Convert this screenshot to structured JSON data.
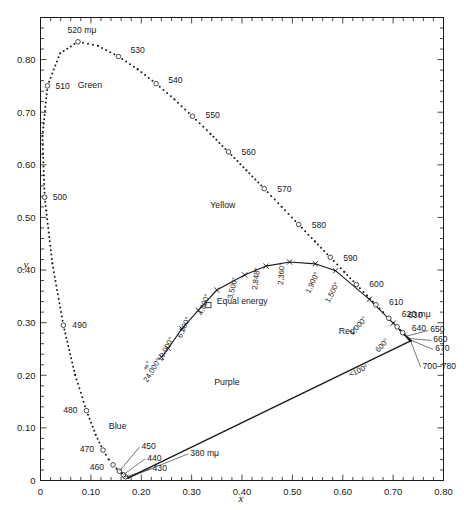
{
  "chart_data": {
    "type": "scatter",
    "title": "",
    "xlabel": "x",
    "ylabel": "y",
    "xlim": [
      0,
      0.8
    ],
    "ylim": [
      0,
      0.88
    ],
    "grid": false,
    "legend": "none",
    "x_ticks": [
      "0",
      "0.10",
      "0.20",
      "0.30",
      "0.40",
      "0.50",
      "0.60",
      "0.70",
      "0.80"
    ],
    "x_tick_values": [
      0,
      0.1,
      0.2,
      0.3,
      0.4,
      0.5,
      0.6,
      0.7,
      0.8
    ],
    "y_ticks": [
      "0",
      "0.10",
      "0.20",
      "0.30",
      "0.40",
      "0.50",
      "0.60",
      "0.70",
      "0.80"
    ],
    "y_tick_values": [
      0,
      0.1,
      0.2,
      0.3,
      0.4,
      0.5,
      0.6,
      0.7,
      0.8
    ],
    "minor_tick_step": 0.02,
    "series": [
      {
        "name": "spectral-locus",
        "style": "dotted-points",
        "points": [
          {
            "wl": 380,
            "x": 0.1741,
            "y": 0.005
          },
          {
            "wl": 385,
            "x": 0.174,
            "y": 0.005
          },
          {
            "wl": 390,
            "x": 0.1738,
            "y": 0.0049
          },
          {
            "wl": 395,
            "x": 0.1736,
            "y": 0.0049
          },
          {
            "wl": 400,
            "x": 0.1733,
            "y": 0.0048
          },
          {
            "wl": 405,
            "x": 0.173,
            "y": 0.0048
          },
          {
            "wl": 410,
            "x": 0.1726,
            "y": 0.0048
          },
          {
            "wl": 415,
            "x": 0.1721,
            "y": 0.0048
          },
          {
            "wl": 420,
            "x": 0.1714,
            "y": 0.0051
          },
          {
            "wl": 425,
            "x": 0.1703,
            "y": 0.0058
          },
          {
            "wl": 430,
            "x": 0.1689,
            "y": 0.0069
          },
          {
            "wl": 435,
            "x": 0.1669,
            "y": 0.0086
          },
          {
            "wl": 440,
            "x": 0.1644,
            "y": 0.0109
          },
          {
            "wl": 445,
            "x": 0.1611,
            "y": 0.0138
          },
          {
            "wl": 450,
            "x": 0.1566,
            "y": 0.0177
          },
          {
            "wl": 455,
            "x": 0.151,
            "y": 0.0227
          },
          {
            "wl": 460,
            "x": 0.144,
            "y": 0.0297
          },
          {
            "wl": 465,
            "x": 0.1355,
            "y": 0.0399
          },
          {
            "wl": 470,
            "x": 0.1241,
            "y": 0.0578
          },
          {
            "wl": 475,
            "x": 0.1096,
            "y": 0.0868
          },
          {
            "wl": 480,
            "x": 0.0913,
            "y": 0.1327
          },
          {
            "wl": 485,
            "x": 0.0687,
            "y": 0.2007
          },
          {
            "wl": 490,
            "x": 0.0454,
            "y": 0.295
          },
          {
            "wl": 495,
            "x": 0.0235,
            "y": 0.4127
          },
          {
            "wl": 500,
            "x": 0.0082,
            "y": 0.5384
          },
          {
            "wl": 505,
            "x": 0.0039,
            "y": 0.6548
          },
          {
            "wl": 510,
            "x": 0.0139,
            "y": 0.7502
          },
          {
            "wl": 515,
            "x": 0.0389,
            "y": 0.812
          },
          {
            "wl": 520,
            "x": 0.0743,
            "y": 0.8338
          },
          {
            "wl": 525,
            "x": 0.1142,
            "y": 0.8262
          },
          {
            "wl": 530,
            "x": 0.1547,
            "y": 0.8059
          },
          {
            "wl": 535,
            "x": 0.1929,
            "y": 0.7816
          },
          {
            "wl": 540,
            "x": 0.2296,
            "y": 0.7543
          },
          {
            "wl": 545,
            "x": 0.2658,
            "y": 0.7243
          },
          {
            "wl": 550,
            "x": 0.3016,
            "y": 0.6923
          },
          {
            "wl": 555,
            "x": 0.3373,
            "y": 0.6589
          },
          {
            "wl": 560,
            "x": 0.3731,
            "y": 0.6245
          },
          {
            "wl": 565,
            "x": 0.4087,
            "y": 0.5896
          },
          {
            "wl": 570,
            "x": 0.4441,
            "y": 0.5547
          },
          {
            "wl": 575,
            "x": 0.4788,
            "y": 0.5202
          },
          {
            "wl": 580,
            "x": 0.5125,
            "y": 0.4866
          },
          {
            "wl": 585,
            "x": 0.5448,
            "y": 0.4544
          },
          {
            "wl": 590,
            "x": 0.5752,
            "y": 0.4242
          },
          {
            "wl": 595,
            "x": 0.6029,
            "y": 0.3965
          },
          {
            "wl": 600,
            "x": 0.627,
            "y": 0.3725
          },
          {
            "wl": 605,
            "x": 0.6482,
            "y": 0.3514
          },
          {
            "wl": 610,
            "x": 0.6658,
            "y": 0.334
          },
          {
            "wl": 615,
            "x": 0.6801,
            "y": 0.3197
          },
          {
            "wl": 620,
            "x": 0.6915,
            "y": 0.3083
          },
          {
            "wl": 625,
            "x": 0.7006,
            "y": 0.2993
          },
          {
            "wl": 630,
            "x": 0.7079,
            "y": 0.292
          },
          {
            "wl": 635,
            "x": 0.714,
            "y": 0.2859
          },
          {
            "wl": 640,
            "x": 0.719,
            "y": 0.2809
          },
          {
            "wl": 645,
            "x": 0.723,
            "y": 0.277
          },
          {
            "wl": 650,
            "x": 0.726,
            "y": 0.274
          },
          {
            "wl": 655,
            "x": 0.7283,
            "y": 0.2717
          },
          {
            "wl": 660,
            "x": 0.73,
            "y": 0.27
          },
          {
            "wl": 665,
            "x": 0.7311,
            "y": 0.2689
          },
          {
            "wl": 670,
            "x": 0.732,
            "y": 0.268
          },
          {
            "wl": 680,
            "x": 0.7334,
            "y": 0.2666
          },
          {
            "wl": 700,
            "x": 0.7347,
            "y": 0.2653
          },
          {
            "wl": 780,
            "x": 0.7347,
            "y": 0.2653
          }
        ],
        "open_circle_wavelengths": [
          430,
          440,
          450,
          460,
          470,
          480,
          490,
          500,
          510,
          520,
          530,
          540,
          550,
          560,
          570,
          580,
          590,
          600,
          610,
          620,
          630,
          640
        ]
      },
      {
        "name": "purple-line",
        "style": "solid-line",
        "points": [
          {
            "x": 0.1741,
            "y": 0.005
          },
          {
            "x": 0.7347,
            "y": 0.2653
          }
        ]
      },
      {
        "name": "planckian-locus",
        "style": "solid-line-with-x-markers",
        "points": [
          {
            "temp": "∞°",
            "x": 0.2399,
            "y": 0.2342
          },
          {
            "temp": "24,000°",
            "x": 0.2534,
            "y": 0.2511
          },
          {
            "temp": "10,000°",
            "x": 0.2807,
            "y": 0.2884
          },
          {
            "temp": "6,500°",
            "x": 0.3135,
            "y": 0.3236
          },
          {
            "temp": "4,800°",
            "x": 0.35,
            "y": 0.362
          },
          {
            "temp": "3,500°",
            "x": 0.4053,
            "y": 0.3907
          },
          {
            "temp": "2,848°",
            "x": 0.4476,
            "y": 0.4075
          },
          {
            "temp": "2,360°",
            "x": 0.4944,
            "y": 0.4153
          },
          {
            "temp": "1,900°",
            "x": 0.5457,
            "y": 0.4118
          },
          {
            "temp": "1,500°",
            "x": 0.5857,
            "y": 0.3988
          },
          {
            "temp": "1,000°",
            "x": 0.6528,
            "y": 0.3444
          },
          {
            "temp": "600°",
            "x": 0.7,
            "y": 0.299
          },
          {
            "temp": "<100°",
            "x": 0.7347,
            "y": 0.2653
          }
        ]
      },
      {
        "name": "equal-energy-point",
        "style": "square-marker",
        "points": [
          {
            "x": 0.3333,
            "y": 0.3333
          }
        ]
      }
    ],
    "wavelength_labels": [
      {
        "text": "520 mμ",
        "wl": 520
      },
      {
        "text": "530",
        "wl": 530
      },
      {
        "text": "540",
        "wl": 540
      },
      {
        "text": "550",
        "wl": 550
      },
      {
        "text": "560",
        "wl": 560
      },
      {
        "text": "570",
        "wl": 570
      },
      {
        "text": "580",
        "wl": 580
      },
      {
        "text": "590",
        "wl": 590
      },
      {
        "text": "600",
        "wl": 600
      },
      {
        "text": "610",
        "wl": 610
      },
      {
        "text": "620 mμ",
        "wl": 620
      },
      {
        "text": "630",
        "wl": 630
      },
      {
        "text": "640",
        "wl": 640
      },
      {
        "text": "650",
        "wl": 650
      },
      {
        "text": "660",
        "wl": 660
      },
      {
        "text": "670",
        "wl": 670
      },
      {
        "text": "700–780",
        "wl": 700
      },
      {
        "text": "510",
        "wl": 510
      },
      {
        "text": "500",
        "wl": 500
      },
      {
        "text": "490",
        "wl": 490
      },
      {
        "text": "480",
        "wl": 480
      },
      {
        "text": "470",
        "wl": 470
      },
      {
        "text": "460",
        "wl": 460
      },
      {
        "text": "450",
        "wl": 450
      },
      {
        "text": "440",
        "wl": 440
      },
      {
        "text": "430",
        "wl": 430
      },
      {
        "text": "380 mμ",
        "wl": 380
      }
    ],
    "region_labels": [
      {
        "text": "Green",
        "x": 0.098,
        "y": 0.746
      },
      {
        "text": "Yellow",
        "x": 0.362,
        "y": 0.518
      },
      {
        "text": "Red",
        "x": 0.608,
        "y": 0.279
      },
      {
        "text": "Purple",
        "x": 0.37,
        "y": 0.182
      },
      {
        "text": "Blue",
        "x": 0.153,
        "y": 0.098
      }
    ],
    "annotations": [
      {
        "text": "Equal energy",
        "x": 0.35,
        "y": 0.336
      }
    ]
  },
  "labels": {
    "eq_520": "520 mμ",
    "eq_530": "530",
    "eq_540": "540",
    "eq_550": "550",
    "eq_560": "560",
    "eq_570": "570",
    "eq_580": "580",
    "eq_590": "590",
    "eq_600": "600",
    "eq_610": "610",
    "eq_620": "620 mμ",
    "eq_630": "630",
    "eq_640": "640",
    "eq_650": "650",
    "eq_660": "660",
    "eq_670": "670",
    "eq_700": "700–780",
    "eq_510": "510",
    "eq_500": "500",
    "eq_490": "490",
    "eq_480": "480",
    "eq_470": "470",
    "eq_460": "460",
    "eq_450": "450",
    "eq_440": "440",
    "eq_430": "430",
    "eq_380": "380 mμ",
    "green": "Green",
    "yellow": "Yellow",
    "red": "Red",
    "purple": "Purple",
    "blue": "Blue",
    "equal_energy": "Equal energy",
    "axis_x": "x",
    "axis_y": "y",
    "t_inf": "∞°",
    "t_24000": "24,000°",
    "t_10000": "10,000°",
    "t_6500": "6,500°",
    "t_4800": "4,800°",
    "t_3500": "3,500°",
    "t_2848": "2,848°",
    "t_2360": "2,360°",
    "t_1900": "1,900°",
    "t_1500": "1,500°",
    "t_1000": "1,000°",
    "t_600": "600°",
    "t_100": "<100°"
  }
}
